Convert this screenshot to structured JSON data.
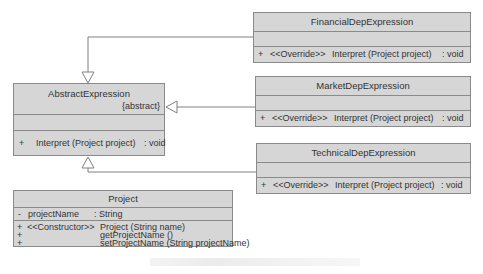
{
  "diagram": {
    "type": "UML class diagram",
    "colors": {
      "class_fill": "#d6d6d6",
      "border": "#8a8a8a",
      "line": "#808080",
      "text": "#333333"
    },
    "classes": {
      "abstract_expression": {
        "name": "AbstractExpression",
        "stereotype": "{abstract}",
        "attributes": [],
        "methods": [
          {
            "visibility": "+",
            "stereotype": "",
            "signature": "Interpret (Project project)",
            "return": ": void"
          }
        ]
      },
      "financial": {
        "name": "FinancialDepExpression",
        "attributes": [],
        "methods": [
          {
            "visibility": "+",
            "stereotype": "<<Override>>",
            "signature": "Interpret (Project project)",
            "return": ": void"
          }
        ]
      },
      "market": {
        "name": "MarketDepExpression",
        "attributes": [],
        "methods": [
          {
            "visibility": "+",
            "stereotype": "<<Override>>",
            "signature": "Interpret (Project project)",
            "return": ": void"
          }
        ]
      },
      "technical": {
        "name": "TechnicalDepExpression",
        "attributes": [],
        "methods": [
          {
            "visibility": "+",
            "stereotype": "<<Override>>",
            "signature": "Interpret (Project project)",
            "return": ": void"
          }
        ]
      },
      "project": {
        "name": "Project",
        "attributes": [
          {
            "visibility": "-",
            "name": "projectName",
            "type": ": String"
          }
        ],
        "methods": [
          {
            "visibility": "+",
            "stereotype": "<<Constructor>>",
            "signature": "Project (String name)"
          },
          {
            "visibility": "+",
            "stereotype": "",
            "signature": "getProjectName ()"
          },
          {
            "visibility": "+",
            "stereotype": "",
            "signature": "setProjectName (String projectName)"
          }
        ]
      }
    },
    "relationships": [
      {
        "from": "FinancialDepExpression",
        "to": "AbstractExpression",
        "kind": "generalization"
      },
      {
        "from": "MarketDepExpression",
        "to": "AbstractExpression",
        "kind": "generalization"
      },
      {
        "from": "TechnicalDepExpression",
        "to": "AbstractExpression",
        "kind": "generalization"
      }
    ]
  }
}
